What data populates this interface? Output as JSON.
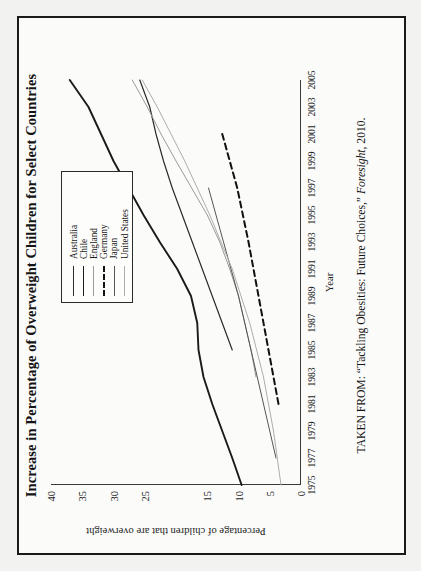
{
  "figure": {
    "title": "Increase in Percentage of Overweight Children for Select Countries",
    "xlabel": "Year",
    "ylabel": "Percentage of children that are overweight",
    "source_prefix": "TAKEN FROM: “Tackling Obesities: Future Choices,” ",
    "source_italic": "Foresight",
    "source_suffix": ", 2010."
  },
  "chart_data": {
    "type": "line",
    "title": "Increase in Percentage of Overweight Children for Select Countries",
    "xlabel": "Year",
    "ylabel": "Percentage of children that are overweight",
    "xlim": [
      1975,
      2005
    ],
    "ylim": [
      0,
      40
    ],
    "grid": false,
    "legend_position": "top-right",
    "xticks": [
      "1975",
      "1977",
      "1979",
      "1981",
      "1983",
      "1985",
      "1987",
      "1989",
      "1991",
      "1993",
      "1995",
      "1997",
      "1999",
      "2001",
      "2003",
      "2005"
    ],
    "yticks": [
      "0",
      "5",
      "10",
      "15",
      "25",
      "30",
      "35",
      "40"
    ],
    "ytick_values": [
      0,
      5,
      10,
      15,
      25,
      30,
      35,
      40
    ],
    "series": [
      {
        "name": "Australia",
        "style": "solid-thin-dark",
        "color": "#2b2b2b",
        "x": [
          1985,
          1987,
          1989,
          1991,
          1993,
          1995,
          1997,
          1999,
          2001,
          2003,
          2005
        ],
        "values": [
          11.0,
          12.6,
          14.2,
          15.8,
          17.4,
          19.0,
          20.6,
          22.0,
          23.2,
          24.2,
          25.8
        ]
      },
      {
        "name": "Chile",
        "style": "solid-thick-dark",
        "color": "#1a1a1a",
        "x": [
          1975,
          1977,
          1979,
          1981,
          1983,
          1985,
          1987,
          1989,
          1991,
          1993,
          1995,
          1997,
          1999,
          2001,
          2003,
          2005
        ],
        "values": [
          9.5,
          11.0,
          12.6,
          14.2,
          15.6,
          16.4,
          16.6,
          17.6,
          19.8,
          22.6,
          25.2,
          27.6,
          30.0,
          32.0,
          34.0,
          37.0
        ]
      },
      {
        "name": "England",
        "style": "solid-thin-grey",
        "color": "#9a9a9a",
        "x": [
          1983,
          1985,
          1987,
          1989,
          1991,
          1993,
          1995,
          1997,
          1999,
          2001,
          2003,
          2005
        ],
        "values": [
          7.2,
          8.0,
          9.0,
          10.0,
          11.4,
          13.0,
          15.0,
          17.5,
          20.0,
          22.4,
          24.6,
          27.0
        ]
      },
      {
        "name": "Germany",
        "style": "dashed-dark",
        "color": "#111111",
        "x": [
          1981,
          1985,
          1989,
          1993,
          1997,
          2001
        ],
        "values": [
          3.6,
          5.2,
          6.8,
          8.4,
          10.2,
          12.6
        ]
      },
      {
        "name": "Japan",
        "style": "solid-thin-mid",
        "color": "#555555",
        "x": [
          1977,
          1981,
          1985,
          1989,
          1993,
          1997
        ],
        "values": [
          4.0,
          6.0,
          8.0,
          10.0,
          12.4,
          14.8
        ]
      },
      {
        "name": "United States",
        "style": "solid-thin-lightgrey",
        "color": "#adadad",
        "x": [
          1975,
          1979,
          1983,
          1987,
          1991,
          1995,
          1999,
          2003,
          2005
        ],
        "values": [
          3.2,
          4.4,
          6.0,
          8.2,
          11.0,
          14.6,
          18.6,
          23.0,
          25.4
        ]
      }
    ]
  },
  "legend": {
    "items": [
      {
        "label": "Australia",
        "style": "solid-thin-dark",
        "color": "#2b2b2b"
      },
      {
        "label": "Chile",
        "style": "solid-thick-dark",
        "color": "#1a1a1a"
      },
      {
        "label": "England",
        "style": "solid-thin-grey",
        "color": "#9a9a9a"
      },
      {
        "label": "Germany",
        "style": "dashed-dark",
        "color": "#111111"
      },
      {
        "label": "Japan",
        "style": "solid-thin-mid",
        "color": "#555555"
      },
      {
        "label": "United States",
        "style": "solid-thin-lightgrey",
        "color": "#adadad"
      }
    ]
  }
}
